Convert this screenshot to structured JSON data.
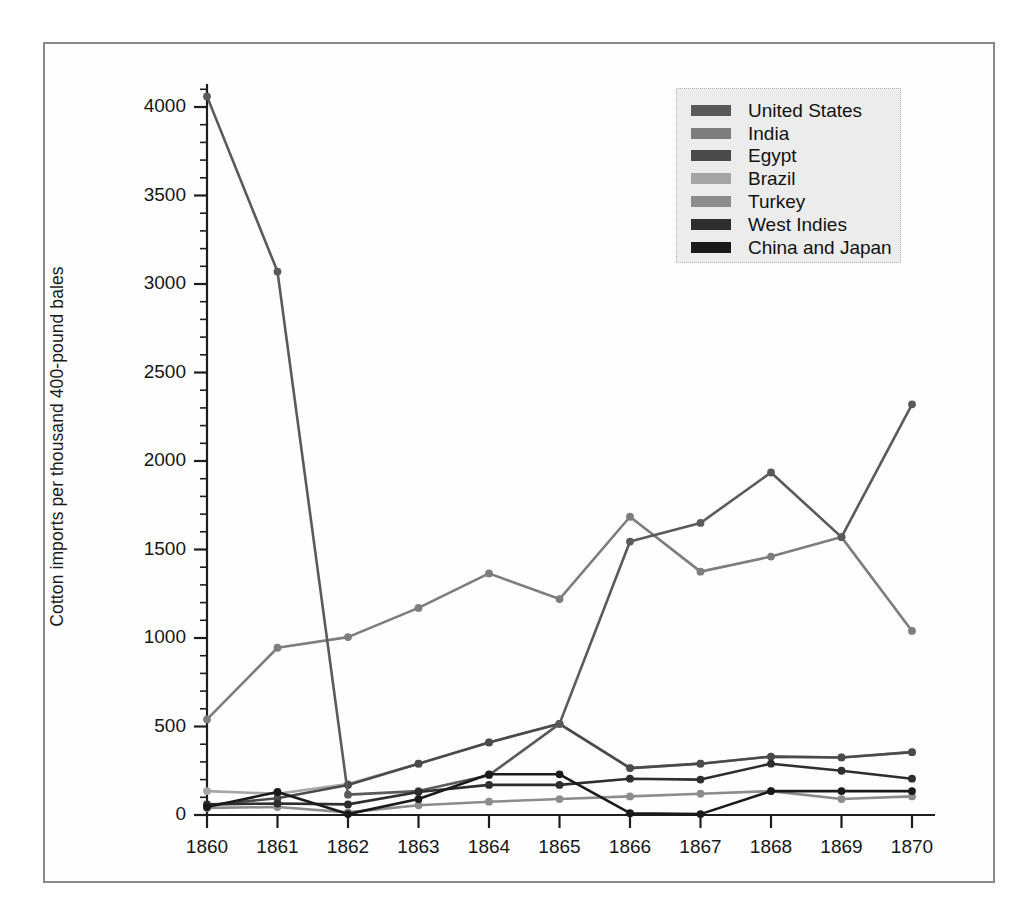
{
  "figure": {
    "background_color": "#ffffff",
    "frame_color": "#8a8a8a"
  },
  "axes": {
    "ylabel": "Cotton imports per thousand 400-pound bales",
    "ytick_labels": [
      "0",
      "500",
      "1000",
      "1500",
      "2000",
      "2500",
      "3000",
      "3500",
      "4000"
    ],
    "xtick_labels": [
      "1860",
      "1861",
      "1862",
      "1863",
      "1864",
      "1865",
      "1866",
      "1867",
      "1868",
      "1869",
      "1870"
    ]
  },
  "legend": {
    "position": "top-right",
    "background_color": "#ececec",
    "entries": [
      {
        "label": "United States",
        "color": "#5a5a5a"
      },
      {
        "label": "India",
        "color": "#7d7d7d"
      },
      {
        "label": "Egypt",
        "color": "#4a4a4a"
      },
      {
        "label": "Brazil",
        "color": "#a5a5a5"
      },
      {
        "label": "Turkey",
        "color": "#8c8c8c"
      },
      {
        "label": "West Indies",
        "color": "#2e2e2e"
      },
      {
        "label": "China and Japan",
        "color": "#1a1a1a"
      }
    ]
  },
  "chart_data": {
    "type": "line",
    "title": "",
    "xlabel": "",
    "ylabel": "Cotton imports per thousand 400-pound bales",
    "categories": [
      1860,
      1861,
      1862,
      1863,
      1864,
      1865,
      1866,
      1867,
      1868,
      1869,
      1870
    ],
    "x": [
      "1860",
      "1861",
      "1862",
      "1863",
      "1864",
      "1865",
      "1866",
      "1867",
      "1868",
      "1869",
      "1870"
    ],
    "xlim": [
      1860,
      1870
    ],
    "ylim": [
      0,
      4200
    ],
    "ytick_values": [
      0,
      500,
      1000,
      1500,
      2000,
      2500,
      3000,
      3500,
      4000
    ],
    "grid": false,
    "legend_position": "upper right",
    "markers": true,
    "series": [
      {
        "name": "United States",
        "color": "#5a5a5a",
        "values": [
          4060,
          3070,
          115,
          135,
          225,
          515,
          1545,
          1650,
          1935,
          1570,
          2320
        ]
      },
      {
        "name": "India",
        "color": "#7d7d7d",
        "values": [
          540,
          945,
          1005,
          1170,
          1365,
          1220,
          1685,
          1375,
          1460,
          1570,
          1040
        ]
      },
      {
        "name": "Egypt",
        "color": "#4a4a4a",
        "values": [
          55,
          95,
          170,
          290,
          410,
          515,
          265,
          290,
          330,
          325,
          355
        ]
      },
      {
        "name": "Brazil",
        "color": "#a5a5a5",
        "values": [
          135,
          120,
          175,
          290,
          410,
          515,
          265,
          290,
          330,
          325,
          355
        ]
      },
      {
        "name": "Turkey",
        "color": "#8c8c8c",
        "values": [
          40,
          45,
          15,
          55,
          75,
          90,
          105,
          120,
          135,
          90,
          105
        ]
      },
      {
        "name": "West Indies",
        "color": "#2e2e2e",
        "values": [
          60,
          65,
          60,
          130,
          170,
          170,
          205,
          200,
          290,
          250,
          205
        ]
      },
      {
        "name": "China and Japan",
        "color": "#1a1a1a",
        "values": [
          45,
          130,
          5,
          90,
          230,
          230,
          10,
          5,
          135,
          135,
          135
        ]
      }
    ]
  }
}
